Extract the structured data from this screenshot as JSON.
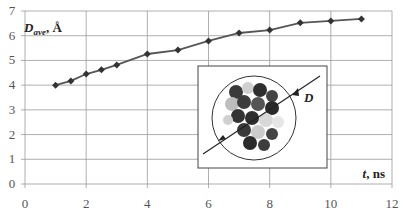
{
  "chart_data": {
    "type": "line",
    "title": "",
    "xlabel": "t, ns",
    "ylabel": "D_ave, Å",
    "ylabel_main": "D",
    "ylabel_sub": "ave",
    "ylabel_unit": ", Å",
    "xlabel_var": "t",
    "xlabel_unit": ", ns",
    "xlim": [
      0,
      12
    ],
    "ylim": [
      0,
      7
    ],
    "xticks": [
      0,
      2,
      4,
      6,
      8,
      10,
      12
    ],
    "yticks": [
      0,
      1,
      2,
      3,
      4,
      5,
      6,
      7
    ],
    "grid": true,
    "legend": null,
    "series": [
      {
        "name": "D_ave",
        "color": "#555555",
        "marker": "diamond",
        "x": [
          1,
          1.5,
          2,
          2.5,
          3,
          4,
          5,
          6,
          7,
          8,
          9,
          10,
          11
        ],
        "y": [
          4.0,
          4.17,
          4.45,
          4.62,
          4.82,
          5.26,
          5.42,
          5.79,
          6.11,
          6.23,
          6.52,
          6.6,
          6.68
        ]
      }
    ],
    "inset": {
      "description": "molecular cluster inside a circle with diameter arrow",
      "annotation": "D"
    }
  }
}
